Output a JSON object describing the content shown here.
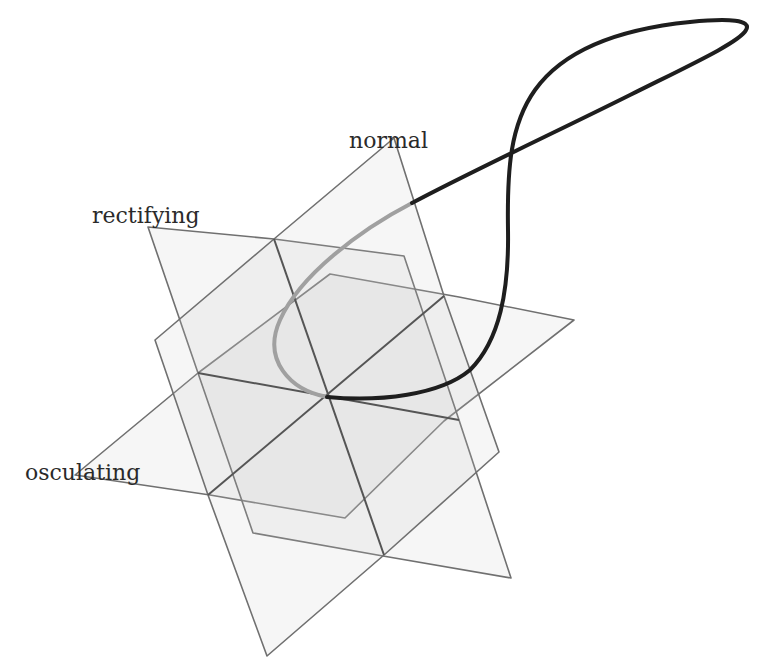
{
  "diagram": {
    "labels": {
      "normal": "normal",
      "rectifying": "rectifying",
      "osculating": "osculating"
    },
    "planes": [
      {
        "id": "normal",
        "spanned_by": [
          "N",
          "B"
        ],
        "fill": "#c8c8c8"
      },
      {
        "id": "rectifying",
        "spanned_by": [
          "T",
          "B"
        ],
        "fill": "#c8c8c8"
      },
      {
        "id": "osculating",
        "spanned_by": [
          "T",
          "N"
        ],
        "fill": "#c8c8c8"
      }
    ],
    "colors": {
      "plane_edge": "#707070",
      "axis": "#555555",
      "curve_near": "#a0a0a0",
      "curve_far": "#1e1e1e",
      "label": "#2a2a2a"
    }
  }
}
